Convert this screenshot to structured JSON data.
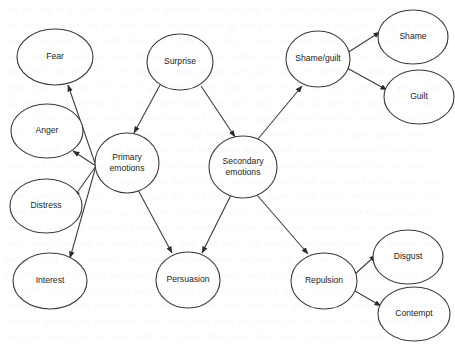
{
  "diagram": {
    "background_color": "#ffffff",
    "stroke_color": "#3a3a3a",
    "text_color": "#1c1c1c",
    "width": 455,
    "height": 346,
    "ghost_text": "scanned page background bleed-through text not legible",
    "nodes": [
      {
        "id": "fear",
        "label": "Fear",
        "cx": 55,
        "cy": 57,
        "rx": 38,
        "ry": 28
      },
      {
        "id": "anger",
        "label": "Anger",
        "cx": 47,
        "cy": 131,
        "rx": 36,
        "ry": 27
      },
      {
        "id": "distress",
        "label": "Distress",
        "cx": 46,
        "cy": 206,
        "rx": 36,
        "ry": 27
      },
      {
        "id": "interest",
        "label": "Interest",
        "cx": 50,
        "cy": 281,
        "rx": 37,
        "ry": 28
      },
      {
        "id": "primary",
        "label": "Primary emotions",
        "cx": 127,
        "cy": 163,
        "rx": 32,
        "ry": 30
      },
      {
        "id": "surprise",
        "label": "Surprise",
        "cx": 180,
        "cy": 62,
        "rx": 33,
        "ry": 28
      },
      {
        "id": "persuasion",
        "label": "Persuasion",
        "cx": 188,
        "cy": 280,
        "rx": 32,
        "ry": 28
      },
      {
        "id": "secondary",
        "label": "Secondary emotions",
        "cx": 243,
        "cy": 167,
        "rx": 34,
        "ry": 31
      },
      {
        "id": "shameguilt",
        "label": "Shame/guilt",
        "cx": 318,
        "cy": 59,
        "rx": 32,
        "ry": 28
      },
      {
        "id": "shame",
        "label": "Shame",
        "cx": 413,
        "cy": 37,
        "rx": 35,
        "ry": 27
      },
      {
        "id": "guilt",
        "label": "Guilt",
        "cx": 419,
        "cy": 97,
        "rx": 35,
        "ry": 27
      },
      {
        "id": "repulsion",
        "label": "Repulsion",
        "cx": 324,
        "cy": 281,
        "rx": 33,
        "ry": 28
      },
      {
        "id": "disgust",
        "label": "Disgust",
        "cx": 408,
        "cy": 257,
        "rx": 35,
        "ry": 27
      },
      {
        "id": "contempt",
        "label": "Contempt",
        "cx": 414,
        "cy": 314,
        "rx": 36,
        "ry": 27
      }
    ],
    "edges": [
      {
        "id": "primary-to-fear",
        "from": "primary",
        "to": "fear",
        "x1": 96,
        "y1": 166,
        "x2": 68,
        "y2": 85
      },
      {
        "id": "primary-to-anger",
        "from": "primary",
        "to": "anger",
        "x1": 96,
        "y1": 166,
        "x2": 73,
        "y2": 151
      },
      {
        "id": "primary-to-distress",
        "from": "primary",
        "to": "distress",
        "x1": 96,
        "y1": 166,
        "x2": 74,
        "y2": 197
      },
      {
        "id": "primary-to-interest",
        "from": "primary",
        "to": "interest",
        "x1": 96,
        "y1": 166,
        "x2": 70,
        "y2": 258
      },
      {
        "id": "surprise-to-primary",
        "from": "surprise",
        "to": "primary",
        "x1": 160,
        "y1": 85,
        "x2": 134,
        "y2": 133
      },
      {
        "id": "surprise-to-secondary",
        "from": "surprise",
        "to": "secondary",
        "x1": 201,
        "y1": 86,
        "x2": 235,
        "y2": 137
      },
      {
        "id": "primary-to-persuasion",
        "from": "primary",
        "to": "persuasion",
        "x1": 138,
        "y1": 190,
        "x2": 172,
        "y2": 253
      },
      {
        "id": "secondary-to-persuasion",
        "from": "secondary",
        "to": "persuasion",
        "x1": 231,
        "y1": 195,
        "x2": 202,
        "y2": 253
      },
      {
        "id": "secondary-to-shameguilt",
        "from": "secondary",
        "to": "shameguilt",
        "x1": 258,
        "y1": 139,
        "x2": 302,
        "y2": 86
      },
      {
        "id": "secondary-to-repulsion",
        "from": "secondary",
        "to": "repulsion",
        "x1": 257,
        "y1": 195,
        "x2": 308,
        "y2": 254
      },
      {
        "id": "shameguilt-to-shame",
        "from": "shameguilt",
        "to": "shame",
        "x1": 347,
        "y1": 53,
        "x2": 380,
        "y2": 32
      },
      {
        "id": "shameguilt-to-guilt",
        "from": "shameguilt",
        "to": "guilt",
        "x1": 347,
        "y1": 68,
        "x2": 387,
        "y2": 90
      },
      {
        "id": "repulsion-to-disgust",
        "from": "repulsion",
        "to": "disgust",
        "x1": 355,
        "y1": 274,
        "x2": 376,
        "y2": 255
      },
      {
        "id": "repulsion-to-contempt",
        "from": "repulsion",
        "to": "contempt",
        "x1": 355,
        "y1": 291,
        "x2": 381,
        "y2": 306
      }
    ]
  }
}
